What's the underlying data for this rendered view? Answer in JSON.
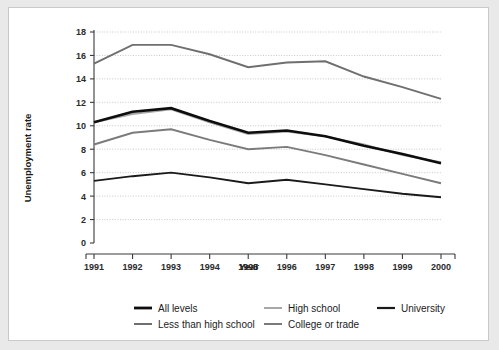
{
  "figure": {
    "background_outer": "#e9e9e9",
    "background_panel": "#ffffff",
    "border_color": "#c9c9c9"
  },
  "chart_data": {
    "type": "line",
    "title": "",
    "xlabel": "Year",
    "ylabel": "Unemployment rate",
    "categories": [
      "1991",
      "1992",
      "1993",
      "1994",
      "1995",
      "1996",
      "1997",
      "1998",
      "1999",
      "2000"
    ],
    "x": [
      1991,
      1992,
      1993,
      1994,
      1995,
      1996,
      1997,
      1998,
      1999,
      2000
    ],
    "ylim": [
      0,
      18
    ],
    "yticks": [
      0,
      2,
      4,
      6,
      8,
      10,
      12,
      14,
      16,
      18
    ],
    "ytick_labels": [
      "0",
      "2",
      "4",
      "6",
      "8",
      "10",
      "12",
      "14",
      "16",
      "18"
    ],
    "grid": "horizontal-dotted",
    "legend_position": "bottom",
    "series": [
      {
        "name": "All levels",
        "color": "#0d0d0d",
        "width": 2.6,
        "values": [
          10.3,
          11.2,
          11.5,
          10.4,
          9.4,
          9.6,
          9.1,
          8.3,
          7.6,
          6.8
        ]
      },
      {
        "name": "High school",
        "color": "#a8a8a8",
        "width": 1.9,
        "values": [
          10.3,
          11.0,
          11.4,
          10.3,
          9.3,
          9.5,
          9.1,
          8.4,
          7.5,
          6.9
        ]
      },
      {
        "name": "University",
        "color": "#1a1a1a",
        "width": 1.9,
        "values": [
          5.3,
          5.7,
          6.0,
          5.6,
          5.1,
          5.4,
          5.0,
          4.6,
          4.2,
          3.9
        ]
      },
      {
        "name": "Less than high school",
        "color": "#6f6f6f",
        "width": 1.9,
        "values": [
          15.3,
          16.9,
          16.9,
          16.1,
          15.0,
          15.4,
          15.5,
          14.2,
          13.3,
          12.3
        ]
      },
      {
        "name": "College or trade",
        "color": "#7b7b7b",
        "width": 1.9,
        "values": [
          8.4,
          9.4,
          9.7,
          8.8,
          8.0,
          8.2,
          7.5,
          6.7,
          5.9,
          5.1
        ]
      }
    ]
  },
  "legend": {
    "entries": [
      {
        "label": "All levels",
        "color": "#0d0d0d",
        "width": 2.8
      },
      {
        "label": "High school",
        "color": "#a8a8a8",
        "width": 2.0
      },
      {
        "label": "University",
        "color": "#1a1a1a",
        "width": 2.2
      },
      {
        "label": "Less than high school",
        "color": "#6f6f6f",
        "width": 2.0
      },
      {
        "label": "College or trade",
        "color": "#7b7b7b",
        "width": 2.0
      }
    ]
  }
}
